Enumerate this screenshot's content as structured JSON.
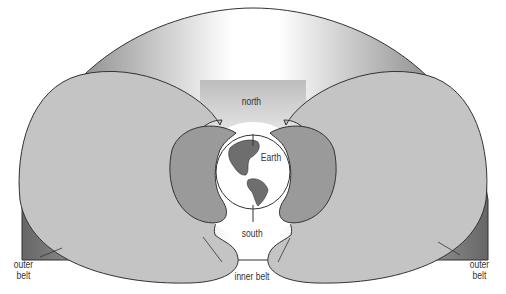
{
  "labels": {
    "north": "north",
    "south": "south",
    "earth": "Earth",
    "inner_belt": "inner belt",
    "outer_belt_left_1": "outer",
    "outer_belt_left_2": "belt",
    "outer_belt_right_1": "outer",
    "outer_belt_right_2": "belt"
  },
  "colors": {
    "outer_belt": "#c4c4c4",
    "inner_belt": "#9a9a9a",
    "outline": "#333333",
    "land": "#6e6e6e"
  }
}
